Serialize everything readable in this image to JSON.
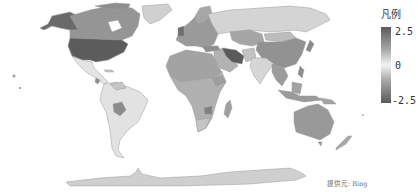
{
  "legend": {
    "title": "凡例",
    "max_label": "2.5",
    "mid_label": "0",
    "min_label": "-2.5",
    "colors": {
      "max": "#5a5a5a",
      "mid": "#f4f4f4",
      "min": "#5a5a5a"
    }
  },
  "attribution": "提供元: Bing",
  "map": {
    "type": "choropleth",
    "projection": "world",
    "fill_default": "#d2d2d2",
    "regions": [
      {
        "name": "United States",
        "shade": "#5c5c5c"
      },
      {
        "name": "Alaska",
        "shade": "#6a6a6a"
      },
      {
        "name": "Canada",
        "shade": "#959595"
      },
      {
        "name": "Greenland",
        "shade": "#d0d0d0"
      },
      {
        "name": "Mexico",
        "shade": "#e4e4e4"
      },
      {
        "name": "South America",
        "shade": "#e2e2e2"
      },
      {
        "name": "Bolivia",
        "shade": "#8c8c8c"
      },
      {
        "name": "Europe",
        "shade": "#9a9a9a"
      },
      {
        "name": "Russia",
        "shade": "#d4d4d4"
      },
      {
        "name": "Central Asia",
        "shade": "#a5a5a5"
      },
      {
        "name": "Iran",
        "shade": "#5a5a5a"
      },
      {
        "name": "Middle East",
        "shade": "#b2b2b2"
      },
      {
        "name": "India",
        "shade": "#d6d6d6"
      },
      {
        "name": "China",
        "shade": "#929292"
      },
      {
        "name": "Southeast Asia",
        "shade": "#9c9c9c"
      },
      {
        "name": "North Africa",
        "shade": "#a3a3a3"
      },
      {
        "name": "Sub-Saharan Africa",
        "shade": "#b0b0b0"
      },
      {
        "name": "Zimbabwe",
        "shade": "#808080"
      },
      {
        "name": "Madagascar",
        "shade": "#a0a0a0"
      },
      {
        "name": "Australia",
        "shade": "#999999"
      },
      {
        "name": "New Zealand",
        "shade": "#a8a8a8"
      },
      {
        "name": "Antarctica",
        "shade": "#cfcfcf"
      }
    ]
  }
}
